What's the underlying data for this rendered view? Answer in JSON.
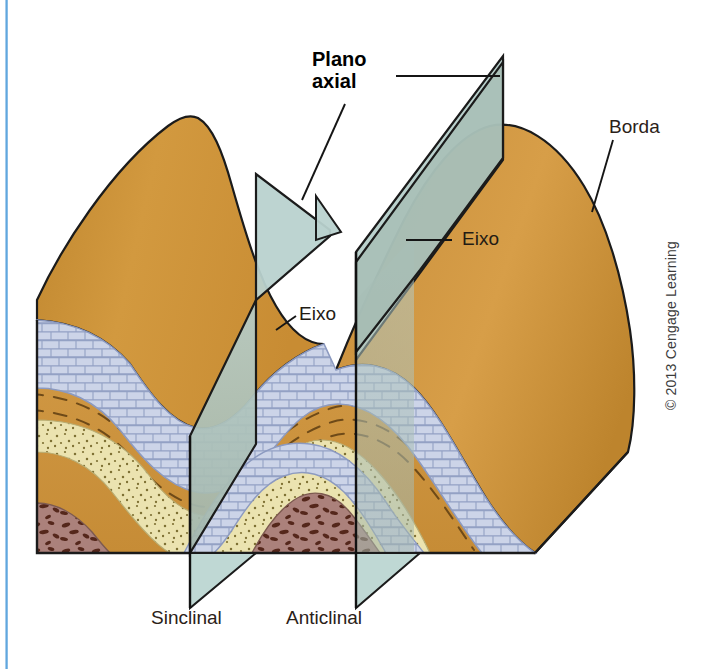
{
  "figure": {
    "title_label": "Plano\naxial",
    "kind": "geologic-block-diagram",
    "description_labels": {
      "axial_plane": "Plano\naxial",
      "hinge_edge": "Borda",
      "axis_anticline": "Eixo",
      "axis_syncline": "Eixo",
      "syncline": "Sinclinal",
      "anticline": "Anticlinal"
    },
    "credit": "© 2013 Cengage Learning"
  },
  "labels": {
    "plano_axial": "Plano\naxial",
    "borda": "Borda",
    "eixo_anticline": "Eixo",
    "eixo_syncline": "Eixo",
    "sinclinal": "Sinclinal",
    "anticlinal": "Anticlinal",
    "copyright": "© 2013 Cengage Learning"
  },
  "colors": {
    "shale_front": "#c98f3f",
    "shale_top": "#cf9340",
    "shale_top_light": "#d7a254",
    "limestone": "#ccd4e8",
    "limestone_line": "#8e9cc0",
    "sandstone": "#ebe3b0",
    "sandstone_dot": "#7a6c32",
    "conglomerate": "#ab817b",
    "conglomerate_clast": "#5c2d1e",
    "axial_plane": "#a9bcb2",
    "axial_plane_upper": "#b3ccc9",
    "outline": "#1b1b1b",
    "leader": "#1a1a1a",
    "rule_blue": "#5ba3dc",
    "background": "#ffffff"
  },
  "strata": [
    {
      "name": "shale",
      "pattern": "dashes",
      "fill": "#cf9340"
    },
    {
      "name": "limestone",
      "pattern": "brick",
      "fill": "#ccd4e8"
    },
    {
      "name": "sandstone",
      "pattern": "stipple",
      "fill": "#ebe3b0"
    },
    {
      "name": "conglomerate",
      "pattern": "clasts",
      "fill": "#ab817b"
    }
  ]
}
